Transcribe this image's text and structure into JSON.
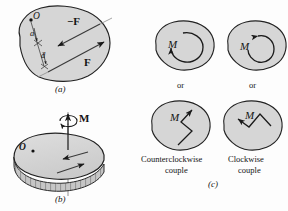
{
  "figure": {
    "background_color": "#fdfdfd",
    "body_fill": "#d6d6d6",
    "body_stroke": "#222222",
    "ink_color": "#141414"
  },
  "panel_a": {
    "caption": "(a)",
    "point_label": "O",
    "distance_a": "a",
    "distance_d": "d",
    "force_neg_label": "−F",
    "force_pos_label": "F"
  },
  "panel_b": {
    "caption": "(b)",
    "point_label": "O",
    "moment_label": "M"
  },
  "panel_c": {
    "caption": "(c)",
    "or_left": "or",
    "or_right": "or",
    "moment_label": "M",
    "left_caption_line1": "Counterclockwise",
    "left_caption_line2": "couple",
    "right_caption_line1": "Clockwise",
    "right_caption_line2": "couple",
    "blobs": [
      {
        "name": "ccw-circular",
        "moment": "M"
      },
      {
        "name": "cw-circular",
        "moment": "M"
      },
      {
        "name": "ccw-zigzag",
        "moment": "M"
      },
      {
        "name": "cw-zigzag",
        "moment": "M"
      }
    ]
  }
}
